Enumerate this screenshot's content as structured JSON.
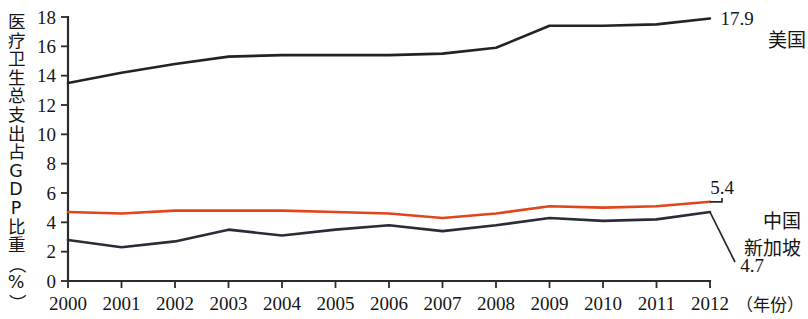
{
  "chart_data": {
    "type": "line",
    "title": "",
    "xlabel": "（年份）",
    "ylabel": "医疗卫生总支出占GDP比重（%）",
    "x": [
      2000,
      2001,
      2002,
      2003,
      2004,
      2005,
      2006,
      2007,
      2008,
      2009,
      2010,
      2011,
      2012
    ],
    "categories": [
      "2000",
      "2001",
      "2002",
      "2003",
      "2004",
      "2005",
      "2006",
      "2007",
      "2008",
      "2009",
      "2010",
      "2011",
      "2012"
    ],
    "ylim": [
      0,
      18
    ],
    "yticks": [
      0,
      2,
      4,
      6,
      8,
      10,
      12,
      14,
      16,
      18
    ],
    "ytick_labels": [
      "0",
      "2",
      "4",
      "6",
      "8",
      "10",
      "12",
      "14",
      "16",
      "18"
    ],
    "grid": false,
    "legend_position": "right-inline-annotations",
    "series": [
      {
        "name": "美国",
        "color": "#232323",
        "end_value_label": "17.9",
        "values": [
          13.5,
          14.2,
          14.8,
          15.3,
          15.4,
          15.4,
          15.4,
          15.5,
          15.9,
          17.4,
          17.4,
          17.5,
          17.9
        ]
      },
      {
        "name": "中国",
        "color": "#e0451c",
        "end_value_label": "5.4",
        "values": [
          4.7,
          4.6,
          4.8,
          4.8,
          4.8,
          4.7,
          4.6,
          4.3,
          4.6,
          5.1,
          5.0,
          5.1,
          5.4
        ]
      },
      {
        "name": "新加坡",
        "color": "#2b2b3a",
        "end_value_label": "4.7",
        "values": [
          2.8,
          2.3,
          2.7,
          3.5,
          3.1,
          3.5,
          3.8,
          3.4,
          3.8,
          4.3,
          4.1,
          4.2,
          4.7
        ]
      }
    ],
    "annotations": [
      {
        "text": "17.9",
        "series": "美国"
      },
      {
        "text": "5.4",
        "series": "中国"
      },
      {
        "text": "4.7",
        "series": "新加坡"
      }
    ]
  },
  "ylabel_chars": [
    "医",
    "疗",
    "卫",
    "生",
    "总",
    "支",
    "出",
    "占",
    "G",
    "D",
    "P",
    "比",
    "重",
    "（",
    "%",
    "）"
  ],
  "legend_labels": {
    "us": "美国",
    "china": "中国",
    "singapore": "新加坡"
  },
  "value_labels": {
    "us": "17.9",
    "china": "5.4",
    "singapore": "4.7"
  },
  "x_axis_caption": "（年份）"
}
